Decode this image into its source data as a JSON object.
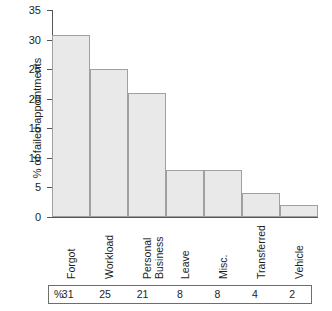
{
  "chart_data": {
    "type": "bar",
    "title": "",
    "xlabel": "",
    "ylabel": "% of failed appointments",
    "ylim": [
      0,
      35
    ],
    "yticks": [
      0,
      5,
      10,
      15,
      20,
      25,
      30,
      35
    ],
    "grid": false,
    "legend": "none",
    "categories": [
      "Forgot",
      "Workload",
      "Personal Business",
      "Leave",
      "Misc.",
      "Transferred",
      "Vehicle"
    ],
    "category_lines": [
      [
        "Forgot"
      ],
      [
        "Workload"
      ],
      [
        "Personal",
        "Business"
      ],
      [
        "Leave"
      ],
      [
        "Misc."
      ],
      [
        "Transferred"
      ],
      [
        "Vehicle"
      ]
    ],
    "values": [
      30.7,
      25,
      21,
      8,
      8,
      4,
      2
    ],
    "bar_color": "#e9e9e9",
    "bar_edge_color": "#a0a0a0",
    "axis_color": "#555555"
  },
  "table": {
    "unit_symbol": "%",
    "values": [
      "31",
      "25",
      "21",
      "8",
      "8",
      "4",
      "2"
    ]
  }
}
